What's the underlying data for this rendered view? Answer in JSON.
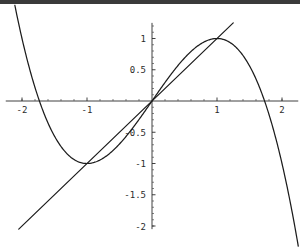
{
  "chart_data": {
    "type": "line",
    "title": "",
    "subtitle": "",
    "xlabel": "",
    "ylabel": "",
    "xlim": [
      -2.25,
      2.25
    ],
    "ylim": [
      -2.05,
      1.25
    ],
    "grid": false,
    "legend": "none",
    "axes_style": "crossed-at-origin",
    "x_ticks_major": [
      -2,
      -1,
      1,
      2
    ],
    "x_tick_labels": [
      "-2",
      "-1",
      "1",
      "2"
    ],
    "x_ticks_minor": [
      -2.0,
      -1.8,
      -1.6,
      -1.4,
      -1.2,
      -0.8,
      -0.6,
      -0.4,
      -0.2,
      0.2,
      0.4,
      0.6,
      0.8,
      1.2,
      1.4,
      1.6,
      1.8,
      2.0
    ],
    "y_ticks_major": [
      1,
      0.5,
      -0.5,
      -1,
      -1.5,
      -2
    ],
    "y_tick_labels": [
      "1",
      "0.5",
      "-0.5",
      "-1",
      "-1.5",
      "-2"
    ],
    "y_ticks_minor": [
      -2.0,
      -1.9,
      -1.8,
      -1.7,
      -1.6,
      -1.4,
      -1.3,
      -1.2,
      -1.1,
      -0.9,
      -0.8,
      -0.7,
      -0.6,
      -0.4,
      -0.3,
      -0.2,
      -0.1,
      0.1,
      0.2,
      0.3,
      0.4,
      0.6,
      0.7,
      0.8,
      0.9,
      1.1,
      1.2
    ],
    "series": [
      {
        "name": "cubic",
        "expression": "1.5*x - 0.5*x^3",
        "color": "#1c1c1c",
        "x": [
          -1.62,
          -1.55,
          -1.45,
          -1.35,
          -1.25,
          -1.15,
          -1.05,
          -1.0,
          -0.95,
          -0.85,
          -0.75,
          -0.65,
          -0.55,
          -0.45,
          -0.35,
          -0.25,
          -0.15,
          -0.05,
          0,
          0.05,
          0.15,
          0.25,
          0.35,
          0.45,
          0.55,
          0.65,
          0.75,
          0.85,
          0.95,
          1.0,
          1.05,
          1.15,
          1.25,
          1.35,
          1.45,
          1.55,
          1.62
        ],
        "y": [
          -0.304,
          -0.463,
          0.0,
          0.2944,
          0.5996,
          0.8043,
          0.9367,
          1.0,
          0.9963,
          0.9679,
          0.9141,
          0.8377,
          0.7418,
          0.6294,
          0.5036,
          0.3672,
          0.2233,
          0.0749,
          0.0,
          -0.0749,
          -0.2233,
          -0.3672,
          -0.5036,
          -0.6294,
          -0.7418,
          -0.8377,
          -0.9141,
          -0.9679,
          -0.9963,
          -1.0,
          -0.9367,
          -0.8043,
          -0.5996,
          -0.2944,
          0.0,
          0.463,
          0.304
        ],
        "note": "odd cubic with local max 1 at x=-1 and local max 1 at x=1 on the visible branch; curve rises on left, peaks at (-1,1), descends through origin, peaks at (1,1), then plunges"
      },
      {
        "name": "line",
        "expression": "y = x",
        "color": "#1c1c1c",
        "x": [
          -2.1,
          2.1
        ],
        "y": [
          -2.1,
          2.1
        ]
      }
    ],
    "key_points": [
      {
        "label": "left-peak",
        "x": -1,
        "y": 1
      },
      {
        "label": "right-peak",
        "x": 1,
        "y": 1
      },
      {
        "label": "origin",
        "x": 0,
        "y": 0
      }
    ]
  },
  "figure": {
    "background_color": "#ffffff",
    "stroke_color": "#1c1c1c",
    "axis_color": "#2b2b2b",
    "top_band_color": "#3a3a3a"
  }
}
